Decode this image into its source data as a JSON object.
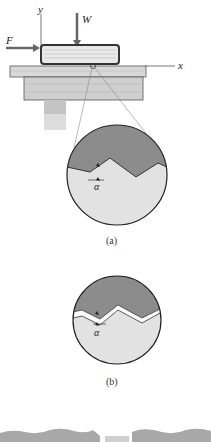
{
  "diagram": {
    "labels": {
      "y_axis": "y",
      "x_axis": "x",
      "weight": "W",
      "force": "F",
      "angle_a": "α",
      "angle_b": "α"
    },
    "captions": {
      "a": "(a)",
      "b": "(b)"
    },
    "colors": {
      "upper_surface": "#8c8c8c",
      "lower_surface": "#e2e2e2",
      "table_wood": "#cfcfcf",
      "book": "#e8e8e8",
      "arrows": "#666666",
      "outline": "#333333"
    }
  }
}
